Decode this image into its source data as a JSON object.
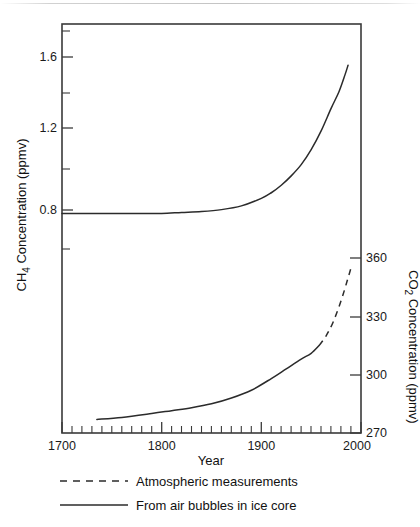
{
  "chart_data": {
    "type": "line",
    "title": "",
    "subtitle": "",
    "xlabel": "Year",
    "xlim": [
      1700,
      2000
    ],
    "x_major_ticks": [
      1700,
      1800,
      1900,
      2000
    ],
    "x_major_tick_labels": [
      "1700",
      "1800",
      "1900",
      "2000"
    ],
    "x_minor_tick_step": 10,
    "grid": false,
    "legend_position": "below-plot-left",
    "axes": [
      {
        "id": "left",
        "label": "CH4 Concentration (ppmv)",
        "label_display": "CH",
        "label_sub": "4",
        "label_rest": " Concentration (ppmv)",
        "unit": "ppmv",
        "lim": [
          0.6,
          1.8
        ],
        "major_ticks": [
          0.8,
          1.2,
          1.6
        ],
        "major_tick_labels": [
          "0.8",
          "1.2",
          "1.6"
        ],
        "minor_ticks": [
          0.6,
          1.0,
          1.4,
          1.8
        ]
      },
      {
        "id": "right",
        "label": "CO2 Concentration (ppmv)",
        "label_display": "CO",
        "label_sub": "2",
        "label_rest": " Concentration (ppmv)",
        "unit": "ppmv",
        "lim": [
          270,
          360
        ],
        "major_ticks": [
          270,
          300,
          330,
          360
        ],
        "major_tick_labels": [
          "270",
          "300",
          "330",
          "360"
        ]
      }
    ],
    "series": [
      {
        "name": "CH4 from air bubbles in ice core",
        "axis": "left",
        "style": "solid",
        "legend_key": "From air bubbles in ice core",
        "x": [
          1700,
          1720,
          1740,
          1760,
          1780,
          1800,
          1820,
          1840,
          1860,
          1880,
          1900,
          1910,
          1920,
          1930,
          1940,
          1950,
          1960,
          1970,
          1978,
          1984,
          1987
        ],
        "y": [
          0.79,
          0.79,
          0.79,
          0.79,
          0.79,
          0.79,
          0.795,
          0.8,
          0.81,
          0.83,
          0.87,
          0.9,
          0.94,
          0.99,
          1.05,
          1.13,
          1.23,
          1.35,
          1.44,
          1.53,
          1.58
        ]
      },
      {
        "name": "CO2 from air bubbles in ice core",
        "axis": "right",
        "style": "solid",
        "legend_key": "From air bubbles in ice core",
        "x": [
          1735,
          1760,
          1790,
          1810,
          1830,
          1850,
          1870,
          1890,
          1910,
          1925,
          1940,
          1950,
          1958
        ],
        "y": [
          277,
          278,
          280,
          281.5,
          283,
          285,
          288,
          292,
          298,
          303,
          308,
          311,
          315
        ]
      },
      {
        "name": "CO2 atmospheric measurements",
        "axis": "right",
        "style": "dashed",
        "legend_key": "Atmospheric measurements",
        "x": [
          1958,
          1965,
          1972,
          1980,
          1986,
          1990
        ],
        "y": [
          315,
          320,
          327,
          338,
          348,
          355
        ]
      }
    ],
    "legend": [
      {
        "style": "dashed",
        "label": "Atmospheric measurements"
      },
      {
        "style": "solid",
        "label": "From air bubbles in ice core"
      }
    ],
    "colors": {
      "line": "#2b2b2b",
      "axis": "#3a3a3a",
      "background": "#ffffff",
      "text": "#111111"
    }
  }
}
